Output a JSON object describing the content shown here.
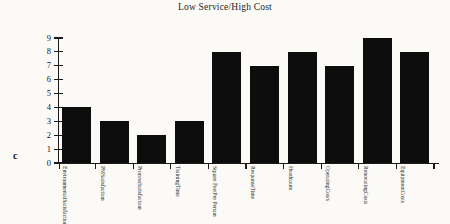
{
  "figure": {
    "panel_letter": "c",
    "title": "Low Service/High Cost"
  },
  "chart_data": {
    "type": "bar",
    "title": "Low Service/High Cost",
    "xlabel": "",
    "ylabel": "",
    "ylim": [
      0,
      9
    ],
    "grid": false,
    "legend": null,
    "bar_color": "#0d0d0d",
    "categories": [
      "Environmental Satisfaction",
      "PM Satisfaction",
      "Process Satisfaction",
      "Training Time",
      "Square Feet Per Person",
      "Response Time",
      "Headcount",
      "Operating Costs",
      "Renovating Costs",
      "Equipment Costs"
    ],
    "category_lines": [
      [
        "Environmental",
        "Satisfaction"
      ],
      [
        "PM",
        "Satisfaction"
      ],
      [
        "Process",
        "Satisfaction"
      ],
      [
        "Training",
        "Time"
      ],
      [
        "Square Feet",
        "Per Person"
      ],
      [
        "Response",
        "Time"
      ],
      [
        "Headcount",
        ""
      ],
      [
        "Operating",
        "Costs"
      ],
      [
        "Renovating",
        "Costs"
      ],
      [
        "Equipment",
        "Costs"
      ]
    ],
    "values": [
      4,
      3,
      2,
      3,
      8,
      7,
      8,
      7,
      9,
      8
    ],
    "ytick_labels": [
      "0",
      "1",
      "2",
      "3",
      "4",
      "5",
      "6",
      "7",
      "8",
      "9"
    ]
  }
}
